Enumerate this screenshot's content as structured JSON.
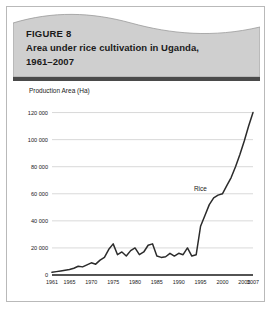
{
  "figure": {
    "number_label": "FIGURE 8",
    "title": "Area under rice cultivation in Uganda,\n1961–2007",
    "title_line1": "Area under rice cultivation in Uganda,",
    "title_line2": "1961–2007"
  },
  "colors": {
    "banner_fill": "#cfcfcf",
    "banner_edge": "#9a9a9a",
    "rule_bar": "#4a4a4a",
    "card_border": "#b9b9b9",
    "gridline": "#c9c9c9",
    "axis": "#1a1a1a",
    "series_line": "#2b2b2b",
    "text": "#1a1a1a",
    "background": "#ffffff"
  },
  "chart_data": {
    "type": "line",
    "title": "Area under rice cultivation in Uganda, 1961–2007",
    "xlabel": "",
    "ylabel": "Production Area (Ha)",
    "ylim": [
      0,
      130000
    ],
    "xlim": [
      1961,
      2007
    ],
    "grid": true,
    "legend_position": "inline-annotation",
    "y_ticks": [
      0,
      20000,
      40000,
      60000,
      80000,
      100000,
      120000
    ],
    "y_tick_labels": [
      "0",
      "20 000",
      "40 000",
      "60 000",
      "80 000",
      "100 000",
      "120 000"
    ],
    "x_ticks": [
      1961,
      1965,
      1970,
      1975,
      1980,
      1985,
      1990,
      1995,
      2000,
      2005,
      2007
    ],
    "x_tick_labels": [
      "1961",
      "1965",
      "1970",
      "1975",
      "1980",
      "1985",
      "1990",
      "1995",
      "2000",
      "2005",
      "2007"
    ],
    "annotations": [
      {
        "text": "Rice",
        "x": 2000,
        "y": 62000
      }
    ],
    "series": [
      {
        "name": "Rice",
        "x": [
          1961,
          1962,
          1963,
          1964,
          1965,
          1966,
          1967,
          1968,
          1969,
          1970,
          1971,
          1972,
          1973,
          1974,
          1975,
          1976,
          1977,
          1978,
          1979,
          1980,
          1981,
          1982,
          1983,
          1984,
          1985,
          1986,
          1987,
          1988,
          1989,
          1990,
          1991,
          1992,
          1993,
          1994,
          1995,
          1996,
          1997,
          1998,
          1999,
          2000,
          2001,
          2002,
          2003,
          2004,
          2005,
          2006,
          2007
        ],
        "values": [
          2000,
          2500,
          3000,
          3500,
          4000,
          5000,
          6500,
          6000,
          7500,
          9000,
          8000,
          11000,
          13000,
          19000,
          23000,
          15000,
          17000,
          14000,
          18000,
          20000,
          15000,
          17000,
          22000,
          23000,
          14000,
          13000,
          13500,
          16000,
          14000,
          16000,
          15000,
          20000,
          14000,
          15000,
          36000,
          44000,
          52000,
          57000,
          59000,
          60000,
          66000,
          72000,
          80000,
          89000,
          99000,
          110000,
          120000
        ]
      }
    ]
  }
}
